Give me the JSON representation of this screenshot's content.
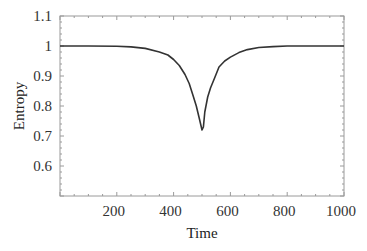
{
  "chart_data": {
    "type": "line",
    "title": "",
    "xlabel": "Time",
    "ylabel": "Entropy",
    "xlim": [
      0,
      1000
    ],
    "ylim": [
      0.5,
      1.1
    ],
    "xticks": [
      200,
      400,
      600,
      800,
      1000
    ],
    "xtick_labels": [
      "200",
      "400",
      "600",
      "800",
      "1000"
    ],
    "yticks": [
      0.6,
      0.7,
      0.8,
      0.9,
      1.0,
      1.1
    ],
    "ytick_labels": [
      "0.6",
      "0.7",
      "0.8",
      "0.9",
      "1",
      "1.1"
    ],
    "grid": false,
    "legend": null,
    "series": [
      {
        "name": "Entropy",
        "color": "#333333",
        "x": [
          0,
          100,
          200,
          250,
          300,
          350,
          380,
          400,
          420,
          440,
          455,
          470,
          480,
          490,
          500,
          505,
          510,
          520,
          530,
          545,
          560,
          580,
          600,
          630,
          660,
          700,
          750,
          800,
          900,
          1000
        ],
        "y": [
          1.0,
          1.0,
          0.999,
          0.997,
          0.992,
          0.98,
          0.97,
          0.955,
          0.935,
          0.905,
          0.875,
          0.83,
          0.8,
          0.76,
          0.72,
          0.73,
          0.78,
          0.83,
          0.86,
          0.895,
          0.93,
          0.95,
          0.963,
          0.978,
          0.988,
          0.995,
          0.998,
          1.0,
          1.0,
          1.0
        ]
      }
    ]
  }
}
